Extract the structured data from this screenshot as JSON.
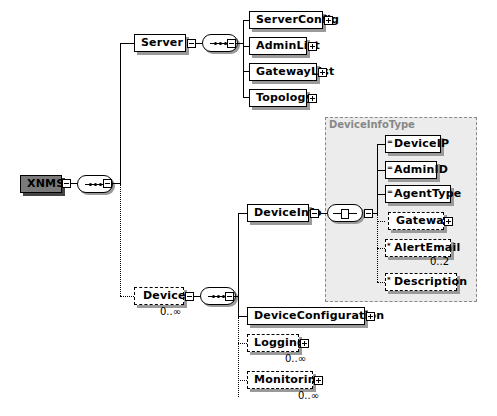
{
  "diagram": {
    "root": {
      "label": "XNMS",
      "compositor": "sequence"
    },
    "server": {
      "label": "Server",
      "compositor": "sequence",
      "children": [
        {
          "label": "ServerConfig",
          "expandable": true
        },
        {
          "label": "AdminList",
          "expandable": true
        },
        {
          "label": "GatewayList",
          "expandable": true
        },
        {
          "label": "Topology",
          "expandable": true
        }
      ]
    },
    "device": {
      "label": "Device",
      "occurrence": "0..∞",
      "optional": true,
      "compositor": "sequence",
      "children": {
        "device_info": {
          "label": "DeviceInfo",
          "compositor": "all",
          "type_group": {
            "title": "DeviceInfoType",
            "children": [
              {
                "label": "DeviceIP",
                "marker": "="
              },
              {
                "label": "AdminID",
                "marker": "="
              },
              {
                "label": "AgentType",
                "marker": "="
              },
              {
                "label": "Gateway",
                "optional": true,
                "expandable": true
              },
              {
                "label": "AlertEmail",
                "marker": "*",
                "optional": true,
                "occurrence": "0..2"
              },
              {
                "label": "Description",
                "marker": "*",
                "optional": true
              }
            ]
          }
        },
        "device_configuration": {
          "label": "DeviceConfiguration",
          "expandable": true
        },
        "logging": {
          "label": "Logging",
          "optional": true,
          "expandable": true,
          "occurrence": "0..∞"
        },
        "monitoring": {
          "label": "Monitoring",
          "optional": true,
          "expandable": true,
          "occurrence": "0..∞"
        }
      }
    },
    "colors": {
      "root_fill": "#7a7a7a",
      "group_fill": "#ececec",
      "group_border": "#888888",
      "shadow": "#9a9a9a"
    }
  }
}
